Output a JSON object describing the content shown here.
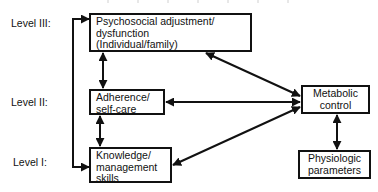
{
  "diagram": {
    "levels": [
      {
        "id": "level-3",
        "label": "Level III:"
      },
      {
        "id": "level-2",
        "label": "Level II:"
      },
      {
        "id": "level-1",
        "label": "Level I:"
      }
    ],
    "nodes": {
      "psychosocial": {
        "label": "Psychosocial adjustment/\ndysfunction\n(Individual/family)",
        "level": "Level III"
      },
      "adherence": {
        "label": "Adherence/\nself-care",
        "level": "Level II"
      },
      "knowledge": {
        "label": "Knowledge/\nmanagement\nskills",
        "level": "Level I"
      },
      "metabolic": {
        "label": "Metabolic\ncontrol"
      },
      "physiologic": {
        "label": "Physiologic\nparameters"
      }
    },
    "edges": [
      {
        "from": "psychosocial",
        "to": "adherence",
        "type": "bidirectional"
      },
      {
        "from": "adherence",
        "to": "knowledge",
        "type": "bidirectional"
      },
      {
        "from": "psychosocial",
        "to": "metabolic",
        "type": "bidirectional"
      },
      {
        "from": "metabolic",
        "to": "adherence",
        "type": "directed"
      },
      {
        "from": "metabolic",
        "to": "knowledge",
        "type": "directed"
      },
      {
        "from": "metabolic",
        "to": "physiologic",
        "type": "bidirectional"
      },
      {
        "from": "left-feedback-loop",
        "to": "psychosocial",
        "type": "directed"
      },
      {
        "from": "left-feedback-loop",
        "to": "knowledge",
        "type": "directed"
      }
    ],
    "colors": {
      "stroke": "#111111",
      "background": "#ffffff"
    }
  }
}
